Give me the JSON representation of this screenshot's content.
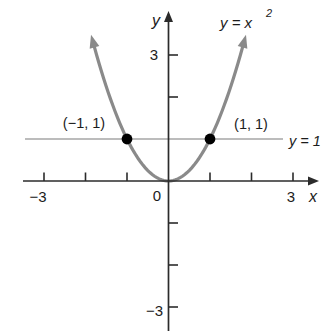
{
  "chart_data": {
    "type": "line",
    "title": "",
    "xlabel": "x",
    "ylabel": "y",
    "xlim": [
      -3.5,
      3.65
    ],
    "ylim": [
      -3.7,
      4.05
    ],
    "grid": false,
    "legend": "none",
    "axis_color": "#2b2b2b",
    "point_color": "#000000",
    "x_ticks": [
      -3,
      -2,
      -1,
      1,
      2,
      3
    ],
    "y_ticks": [
      3,
      2,
      -1,
      -2,
      -3
    ],
    "x_tick_labels": [
      {
        "value": -3,
        "text": "−3"
      },
      {
        "value": 0,
        "text": "0"
      },
      {
        "value": 3,
        "text": "3"
      }
    ],
    "y_tick_labels": [
      {
        "value": 3,
        "text": "3"
      },
      {
        "value": -3,
        "text": "−3"
      }
    ],
    "series": [
      {
        "name": "y = x²",
        "expr": "y = x^2",
        "x_domain": [
          -1.79,
          1.79
        ],
        "color": "#8a8a8a",
        "stroke_width": 3.2,
        "arrows": "both-ends",
        "points_sample": [
          [
            -1.5,
            2.25
          ],
          [
            -1,
            1
          ],
          [
            -0.5,
            0.25
          ],
          [
            0,
            0
          ],
          [
            0.5,
            0.25
          ],
          [
            1,
            1
          ],
          [
            1.5,
            2.25
          ]
        ]
      }
    ],
    "curve_label": {
      "base": "y = x",
      "exponent": "2",
      "full": "y = x²"
    },
    "horizontal_line": {
      "y": 1,
      "label": "y = 1",
      "color": "#a6a6a6",
      "label_color": "#9b9b9b"
    },
    "marked_points": [
      {
        "x": -1,
        "y": 1,
        "label": "(−1, 1)"
      },
      {
        "x": 1,
        "y": 1,
        "label": "(1, 1)"
      }
    ]
  }
}
